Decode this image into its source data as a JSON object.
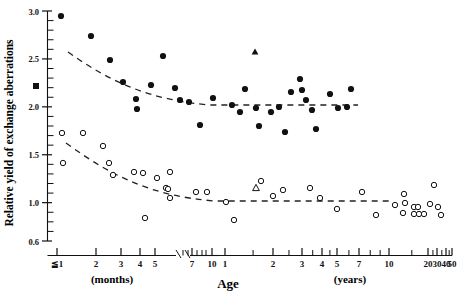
{
  "figure": {
    "ylabel": "Relative yield of exchange aberrations",
    "xlabel": "Age",
    "x_group_months": "(months)",
    "x_group_years": "(years)"
  },
  "chart_data": {
    "type": "scatter",
    "title": "",
    "xlabel": "Age",
    "ylabel": "Relative yield of exchange aberrations",
    "x_scale": "log (broken axis: months segment then years segment)",
    "ylim": [
      0.6,
      3.0
    ],
    "y_ticks_major": [
      "3.0",
      "2.5",
      "2.0",
      "1.5",
      "1.0",
      "0.6"
    ],
    "y_tick_values_major": [
      3.0,
      2.5,
      2.0,
      1.5,
      1.0,
      0.6
    ],
    "y_minor_step": 0.1,
    "grid": false,
    "legend": "none",
    "x_ticks_months": [
      "≦1",
      "2",
      "3",
      "4",
      "5"
    ],
    "x_tick_values_months": [
      1,
      2,
      3,
      4,
      5
    ],
    "x_ticks_months_upper": [
      "7",
      "10"
    ],
    "x_tick_values_months_upper": [
      7,
      10
    ],
    "x_ticks_years": [
      "1",
      "2",
      "3",
      "4",
      "5",
      "7",
      "10",
      "20",
      "30",
      "40",
      "50"
    ],
    "x_tick_values_years": [
      1,
      2,
      3,
      4,
      5,
      7,
      10,
      20,
      30,
      40,
      50
    ],
    "series": [
      {
        "name": "upper series (filled circles)",
        "marker": "filled-circle",
        "color": "#111111",
        "points": [
          {
            "px": 61,
            "py": 16,
            "x_label": "≦1 month",
            "y": 2.92
          },
          {
            "px": 91,
            "py": 36,
            "x_label": "1.5 months",
            "y": 2.73
          },
          {
            "px": 110,
            "py": 60,
            "x_label": "2 months",
            "y": 2.5
          },
          {
            "px": 123,
            "py": 82,
            "x_label": "2.5 months",
            "y": 2.27
          },
          {
            "px": 136,
            "py": 99,
            "x_label": "3 months",
            "y": 2.09
          },
          {
            "px": 137,
            "py": 109,
            "x_label": "3 months",
            "y": 1.99
          },
          {
            "px": 163,
            "py": 56,
            "x_label": "4.5 months",
            "y": 2.54
          },
          {
            "px": 175,
            "py": 88,
            "x_label": "5 months",
            "y": 2.21
          },
          {
            "px": 180,
            "py": 100,
            "x_label": "5 months",
            "y": 2.09
          },
          {
            "px": 189,
            "py": 102,
            "x_label": "7 months",
            "y": 2.07
          },
          {
            "px": 200,
            "py": 125,
            "x_label": "8 months",
            "y": 1.83
          },
          {
            "px": 151,
            "py": 85,
            "x_label": "4 months",
            "y": 2.24
          },
          {
            "px": 213,
            "py": 98,
            "x_label": "10 months",
            "y": 2.11
          },
          {
            "px": 232,
            "py": 105,
            "x_label": "1 year",
            "y": 2.04
          },
          {
            "px": 240,
            "py": 112,
            "x_label": "1.1 years",
            "y": 1.97
          },
          {
            "px": 245,
            "py": 89,
            "x_label": "1.2 years",
            "y": 2.21
          },
          {
            "px": 256,
            "py": 108,
            "x_label": "1.4 years",
            "y": 2.01
          },
          {
            "px": 259,
            "py": 126,
            "x_label": "1.5 years",
            "y": 1.82
          },
          {
            "px": 279,
            "py": 107,
            "x_label": "2 years",
            "y": 2.02
          },
          {
            "px": 285,
            "py": 132,
            "x_label": "2.2 years",
            "y": 1.77
          },
          {
            "px": 300,
            "py": 79,
            "x_label": "3 years",
            "y": 2.31
          },
          {
            "px": 291,
            "py": 92,
            "x_label": "2.6 years",
            "y": 2.19
          },
          {
            "px": 302,
            "py": 90,
            "x_label": "3 years",
            "y": 2.21
          },
          {
            "px": 306,
            "py": 100,
            "x_label": "3.2 years",
            "y": 2.11
          },
          {
            "px": 312,
            "py": 110,
            "x_label": "3.5 years",
            "y": 2.01
          },
          {
            "px": 316,
            "py": 129,
            "x_label": "3.8 years",
            "y": 1.81
          },
          {
            "px": 330,
            "py": 94,
            "x_label": "5 years",
            "y": 2.16
          },
          {
            "px": 338,
            "py": 108,
            "x_label": "5.5 years",
            "y": 2.02
          },
          {
            "px": 347,
            "py": 107,
            "x_label": "6.5 years",
            "y": 2.03
          },
          {
            "px": 351,
            "py": 89,
            "x_label": "7 years",
            "y": 2.22
          },
          {
            "px": 271,
            "py": 112,
            "x_label": "1.8 years",
            "y": 1.97
          }
        ]
      },
      {
        "name": "upper series (filled square)",
        "marker": "filled-square",
        "color": "#111111",
        "points": [
          {
            "px": 36,
            "py": 86,
            "x_label": "≦1 month",
            "y": 2.25
          }
        ]
      },
      {
        "name": "upper series (filled triangle)",
        "marker": "filled-triangle",
        "color": "#111111",
        "points": [
          {
            "px": 255,
            "py": 52,
            "x_label": "1.4 years",
            "y": 2.58
          }
        ]
      },
      {
        "name": "lower series (open circles)",
        "marker": "open-circle",
        "color": "#111111",
        "points": [
          {
            "px": 62,
            "py": 133,
            "x_label": "≦1 month",
            "y": 1.83
          },
          {
            "px": 63,
            "py": 163,
            "x_label": "≦1 month",
            "y": 1.5
          },
          {
            "px": 83,
            "py": 133,
            "x_label": "1.4 months",
            "y": 1.83
          },
          {
            "px": 103,
            "py": 146,
            "x_label": "2 months",
            "y": 1.68
          },
          {
            "px": 109,
            "py": 163,
            "x_label": "2.2 months",
            "y": 1.5
          },
          {
            "px": 113,
            "py": 175,
            "x_label": "2.4 months",
            "y": 1.36
          },
          {
            "px": 134,
            "py": 172,
            "x_label": "3 months",
            "y": 1.4
          },
          {
            "px": 143,
            "py": 173,
            "x_label": "3.5 months",
            "y": 1.38
          },
          {
            "px": 157,
            "py": 178,
            "x_label": "4.5 months",
            "y": 1.34
          },
          {
            "px": 170,
            "py": 172,
            "x_label": "5 months",
            "y": 1.41
          },
          {
            "px": 166,
            "py": 188,
            "x_label": "5 months",
            "y": 1.23
          },
          {
            "px": 168,
            "py": 189,
            "x_label": "5 months",
            "y": 1.22
          },
          {
            "px": 170,
            "py": 198,
            "x_label": "5 months",
            "y": 1.13
          },
          {
            "px": 145,
            "py": 218,
            "x_label": "3.5 months",
            "y": 0.93
          },
          {
            "px": 196,
            "py": 192,
            "x_label": "8 months",
            "y": 1.18
          },
          {
            "px": 207,
            "py": 192,
            "x_label": "10 months",
            "y": 1.18
          },
          {
            "px": 226,
            "py": 202,
            "x_label": "1 year",
            "y": 1.07
          },
          {
            "px": 234,
            "py": 220,
            "x_label": "1.1 years",
            "y": 0.9
          },
          {
            "px": 261,
            "py": 181,
            "x_label": "1.5 years",
            "y": 1.3
          },
          {
            "px": 273,
            "py": 196,
            "x_label": "1.8 years",
            "y": 1.15
          },
          {
            "px": 283,
            "py": 190,
            "x_label": "2.2 years",
            "y": 1.21
          },
          {
            "px": 310,
            "py": 188,
            "x_label": "3.2 years",
            "y": 1.23
          },
          {
            "px": 320,
            "py": 198,
            "x_label": "4 years",
            "y": 1.13
          },
          {
            "px": 337,
            "py": 209,
            "x_label": "5 years",
            "y": 1.02
          },
          {
            "px": 362,
            "py": 192,
            "x_label": "8 years",
            "y": 1.18
          },
          {
            "px": 395,
            "py": 205,
            "x_label": "18 years",
            "y": 1.06
          },
          {
            "px": 404,
            "py": 194,
            "x_label": "20 years",
            "y": 1.17
          },
          {
            "px": 405,
            "py": 203,
            "x_label": "20 years",
            "y": 1.08
          },
          {
            "px": 403,
            "py": 213,
            "x_label": "20 years",
            "y": 0.98
          },
          {
            "px": 414,
            "py": 207,
            "x_label": "25 years",
            "y": 1.04
          },
          {
            "px": 418,
            "py": 207,
            "x_label": "26 years",
            "y": 1.04
          },
          {
            "px": 414,
            "py": 214,
            "x_label": "25 years",
            "y": 0.97
          },
          {
            "px": 419,
            "py": 214,
            "x_label": "27 years",
            "y": 0.97
          },
          {
            "px": 424,
            "py": 214,
            "x_label": "30 years",
            "y": 0.97
          },
          {
            "px": 430,
            "py": 204,
            "x_label": "33 years",
            "y": 1.07
          },
          {
            "px": 438,
            "py": 207,
            "x_label": "40 years",
            "y": 1.04
          },
          {
            "px": 434,
            "py": 185,
            "x_label": "36 years",
            "y": 1.26
          },
          {
            "px": 441,
            "py": 215,
            "x_label": "42 years",
            "y": 0.96
          },
          {
            "px": 376,
            "py": 215,
            "x_label": "12 years",
            "y": 0.96
          }
        ]
      },
      {
        "name": "lower series (open triangle)",
        "marker": "open-triangle",
        "color": "#111111",
        "points": [
          {
            "px": 256,
            "py": 188,
            "x_label": "1.4 years",
            "y": 1.22
          }
        ]
      }
    ],
    "fit_curves": [
      {
        "name": "upper fitted decay curve",
        "style": "dashed",
        "asymptote_y": 2.02,
        "path": "M 68,52 C 110,82 150,100 210,105 L 358,105"
      },
      {
        "name": "lower fitted decay curve",
        "style": "dashed",
        "asymptote_y": 1.03,
        "path": "M 66,143 C 110,175 150,196 215,201 L 392,201"
      }
    ]
  }
}
